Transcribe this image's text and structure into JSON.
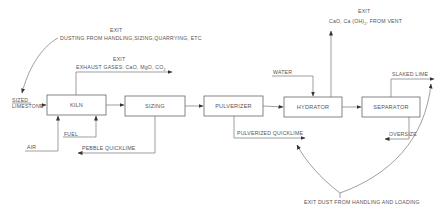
{
  "diagram": {
    "type": "process-flow",
    "boxes": [
      {
        "id": "kiln",
        "label": "KILN"
      },
      {
        "id": "sizing",
        "label": "SIZING"
      },
      {
        "id": "pulverizer",
        "label": "PULVERIZER"
      },
      {
        "id": "hydrator",
        "label": "HYDRATOR"
      },
      {
        "id": "separator",
        "label": "SEPARATOR"
      }
    ],
    "inputs": {
      "sized_limestone_line1": "SIZED",
      "sized_limestone_line2": "LIMESTONE",
      "fuel": "FUEL",
      "air": "AIR",
      "water": "WATER"
    },
    "outputs": {
      "pebble_quicklime": "PEBBLE  QUICKLIME",
      "pulverized_quicklime": "PULVERIZED  QUICKLIME",
      "oversize": "OVERSIZE",
      "slaked_lime": "SLAKED  LIME"
    },
    "exits": {
      "dusting": {
        "title": "EXIT",
        "text": "DUSTING FROM HANDLING,SIZING,QUARRYING, ETC"
      },
      "exhaust": {
        "title": "EXIT",
        "text": "EXHAUST GASES: CaO, MgO, CO",
        "subscript": "2"
      },
      "vent": {
        "title": "EXIT",
        "text_pre": "CaO, Ca (OH)",
        "subscript": "2",
        "text_post": ", FROM  VENT"
      },
      "handling": {
        "text": "EXIT DUST  FROM HANDLING AND LOADING"
      }
    },
    "edges": [
      {
        "from": "sized_limestone",
        "to": "kiln"
      },
      {
        "from": "fuel",
        "to": "kiln"
      },
      {
        "from": "air",
        "to": "kiln"
      },
      {
        "from": "kiln",
        "to": "sizing"
      },
      {
        "from": "kiln",
        "to": "exhaust_exit"
      },
      {
        "from": "sizing",
        "to": "pulverizer"
      },
      {
        "from": "sizing",
        "to": "pebble_quicklime"
      },
      {
        "from": "pulverizer",
        "to": "hydrator"
      },
      {
        "from": "pulverizer",
        "to": "pulverized_quicklime"
      },
      {
        "from": "water",
        "to": "hydrator"
      },
      {
        "from": "hydrator",
        "to": "vent_exit"
      },
      {
        "from": "hydrator",
        "to": "separator"
      },
      {
        "from": "separator",
        "to": "slaked_lime"
      },
      {
        "from": "separator",
        "to": "oversize"
      },
      {
        "from": "dusting_exit",
        "to": "sized_limestone"
      },
      {
        "from": "handling_exit",
        "to": "pulverized_quicklime"
      },
      {
        "from": "handling_exit",
        "to": "slaked_lime"
      }
    ]
  }
}
